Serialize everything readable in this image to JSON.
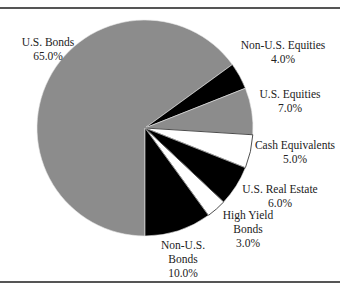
{
  "chart_data": {
    "type": "pie",
    "title": "",
    "categories": [
      "U.S. Bonds",
      "Non-U.S. Equities",
      "U.S. Equities",
      "Cash Equivalents",
      "U.S. Real Estate",
      "High Yield Bonds",
      "Non-U.S. Bonds"
    ],
    "values": [
      65.0,
      4.0,
      7.0,
      5.0,
      6.0,
      3.0,
      10.0
    ],
    "value_labels": [
      "65.0%",
      "4.0%",
      "7.0%",
      "5.0%",
      "6.0%",
      "3.0%",
      "10.0%"
    ],
    "colors": [
      "#8c8c8c",
      "#000000",
      "#8c8c8c",
      "#ffffff",
      "#000000",
      "#ffffff",
      "#000000"
    ],
    "legend": "none (direct labels)",
    "start_angle_deg_clockwise_from_top": 180
  },
  "labels": {
    "us_bonds": {
      "name": "U.S. Bonds",
      "value": "65.0%"
    },
    "non_us_equities": {
      "name": "Non-U.S. Equities",
      "value": "4.0%"
    },
    "us_equities": {
      "name": "U.S. Equities",
      "value": "7.0%"
    },
    "cash_equivalents": {
      "name": "Cash Equivalents",
      "value": "5.0%"
    },
    "us_real_estate": {
      "name": "U.S. Real Estate",
      "value": "6.0%"
    },
    "high_yield_bonds": {
      "name1": "High Yield",
      "name2": "Bonds",
      "value": "3.0%"
    },
    "non_us_bonds": {
      "name1": "Non-U.S.",
      "name2": "Bonds",
      "value": "10.0%"
    }
  }
}
